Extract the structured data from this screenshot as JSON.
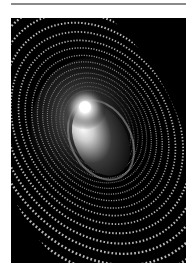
{
  "page": {
    "divider": "top-rule"
  },
  "artwork": {
    "subject": "binary digit vortex around glowing ellipse",
    "digits": "0101101001011010010110100101101001011010",
    "colors": {
      "background": "#000000",
      "digits": "#d8d8d8",
      "glow": "#ffffff",
      "core": "#1a1a1a"
    }
  }
}
